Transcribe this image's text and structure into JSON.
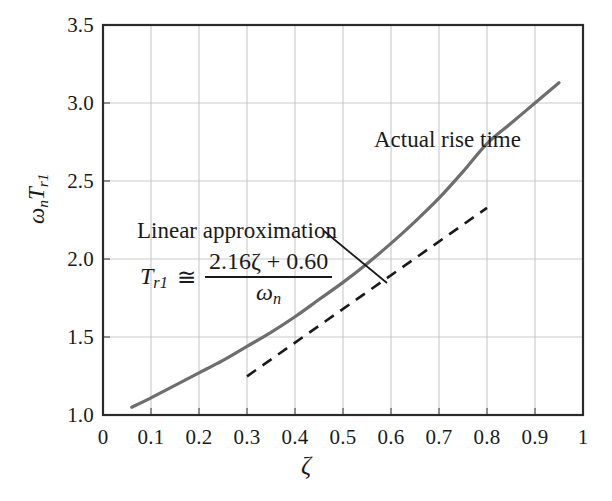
{
  "chart_data": {
    "type": "line",
    "title": "",
    "xlabel": "ζ",
    "ylabel": "ωₙTᵣ₁",
    "xlim": [
      0,
      1
    ],
    "ylim": [
      1.0,
      3.5
    ],
    "grid": true,
    "legend_position": "inline-annotations",
    "xticks": [
      "0",
      "0.1",
      "0.2",
      "0.3",
      "0.4",
      "0.5",
      "0.6",
      "0.7",
      "0.8",
      "0.9",
      "1"
    ],
    "xtick_values": [
      0,
      0.1,
      0.2,
      0.3,
      0.4,
      0.5,
      0.6,
      0.7,
      0.8,
      0.9,
      1.0
    ],
    "yticks": [
      "1.0",
      "1.5",
      "2.0",
      "2.5",
      "3.0",
      "3.5"
    ],
    "ytick_values": [
      1.0,
      1.5,
      2.0,
      2.5,
      3.0,
      3.5
    ],
    "series": [
      {
        "name": "Actual rise time",
        "style": "solid",
        "color": "#6e6e6e",
        "width": 3.2,
        "x": [
          0.06,
          0.1,
          0.15,
          0.2,
          0.25,
          0.3,
          0.35,
          0.4,
          0.45,
          0.5,
          0.55,
          0.6,
          0.65,
          0.7,
          0.75,
          0.8,
          0.85,
          0.9,
          0.95
        ],
        "y": [
          1.05,
          1.11,
          1.19,
          1.27,
          1.35,
          1.44,
          1.53,
          1.63,
          1.74,
          1.85,
          1.97,
          2.1,
          2.24,
          2.39,
          2.56,
          2.74,
          2.87,
          3.0,
          3.13
        ]
      },
      {
        "name": "Linear approximation",
        "style": "dashed",
        "color": "#1a1a1a",
        "width": 2.6,
        "x": [
          0.3,
          0.8
        ],
        "y": [
          1.248,
          2.328
        ],
        "formula_slope": 2.16,
        "formula_intercept": 0.6
      }
    ],
    "annotations": [
      {
        "name": "actual-rise-time",
        "text": "Actual rise time",
        "x_px": 374,
        "y_px": 127
      },
      {
        "name": "linear-approximation",
        "text": "Linear approximation",
        "x_px": 137,
        "y_px": 218,
        "leader_from_px": [
          324,
          231
        ],
        "leader_to_px": [
          387,
          283
        ]
      },
      {
        "name": "rise-time-formula",
        "lhs": "T",
        "lhs_sub": "r1",
        "relation": "≅",
        "numerator": "2.16ζ + 0.60",
        "denominator": "ω",
        "denominator_sub": "n"
      }
    ]
  },
  "labels": {
    "actual_rise_time": "Actual rise time",
    "linear_approximation": "Linear approximation",
    "xaxis_symbol": "ζ",
    "yaxis_omega": "ω",
    "yaxis_omega_sub": "n",
    "yaxis_T": "T",
    "yaxis_T_sub": "r1",
    "formula_lhs": "T",
    "formula_lhs_sub": "r1",
    "formula_relation": "≅",
    "formula_numerator": "2.16ζ + 0.60",
    "formula_denominator": "ω",
    "formula_denominator_sub": "n"
  },
  "colors": {
    "curve": "#6e6e6e",
    "dashed": "#1a1a1a",
    "grid": "#c9c9c9",
    "frame": "#2b2b2b",
    "text": "#1a1a1a",
    "background": "#ffffff"
  }
}
